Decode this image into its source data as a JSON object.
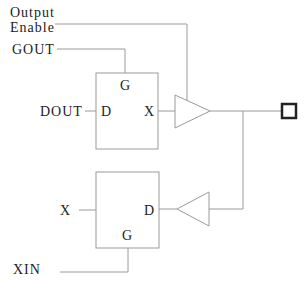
{
  "diagram": {
    "signals": {
      "output_enable_line1": "Output",
      "output_enable_line2": "Enable",
      "gout": "GOUT",
      "dout": "DOUT",
      "x_in": "X",
      "xin": "XIN"
    },
    "output_latch": {
      "gate_label": "G",
      "data_label": "D",
      "output_label": "X"
    },
    "input_latch": {
      "gate_label": "G",
      "data_label": "D"
    },
    "output_buffer": "tristate-output-buffer",
    "input_buffer": "input-buffer",
    "pad": "io-pad"
  }
}
